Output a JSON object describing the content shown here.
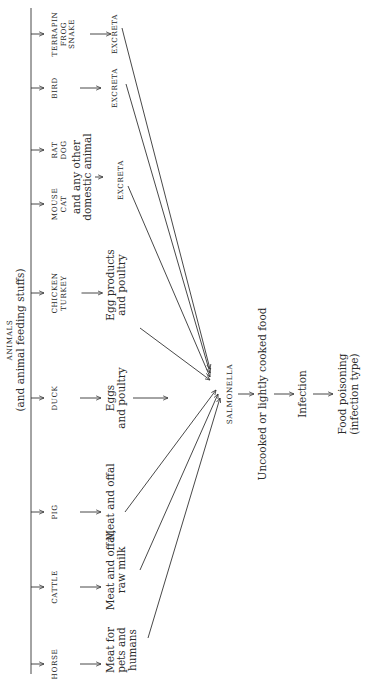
{
  "header": {
    "title": "ANIMALS",
    "subtitle": "(and animal feeding stuffs)"
  },
  "animals": [
    {
      "id": "horse",
      "lines": [
        "HORSE"
      ],
      "x": 16
    },
    {
      "id": "cattle",
      "lines": [
        "CATTLE"
      ],
      "x": 93
    },
    {
      "id": "pig",
      "lines": [
        "PIG"
      ],
      "x": 168
    },
    {
      "id": "duck",
      "lines": [
        "DUCK"
      ],
      "x": 282
    },
    {
      "id": "chicken",
      "lines": [
        "CHICKEN",
        "TURKEY"
      ],
      "x": 387
    },
    {
      "id": "mouse",
      "lines": [
        "MOUSE",
        "CAT"
      ],
      "x": 476
    },
    {
      "id": "rat",
      "lines": [
        "RAT",
        "DOG"
      ],
      "x": 530
    },
    {
      "id": "bird",
      "lines": [
        "BIRD"
      ],
      "x": 592
    },
    {
      "id": "terrapin",
      "lines": [
        "TERRAPIN",
        "FROG",
        "SNAKE"
      ],
      "x": 646
    }
  ],
  "products": [
    {
      "id": "pets-meat",
      "lines": [
        "Meat for",
        "pets and",
        "humans"
      ],
      "x": 30
    },
    {
      "id": "cattle-meat",
      "lines": [
        "Meat and offal,",
        "raw milk"
      ],
      "x": 110
    },
    {
      "id": "pig-meat",
      "lines": [
        "Meat and offal"
      ],
      "x": 178
    },
    {
      "id": "duck-eggs",
      "lines": [
        "Eggs",
        "and poultry"
      ],
      "x": 282
    },
    {
      "id": "chicken-eggs",
      "lines": [
        "Egg products",
        "and poultry"
      ],
      "x": 395
    }
  ],
  "domestic_note": [
    "and any other",
    "domestic animal"
  ],
  "excreta": [
    {
      "id": "excreta-domestic",
      "label": "EXCRETA",
      "x": 500
    },
    {
      "id": "excreta-bird",
      "label": "EXCRETA",
      "x": 592
    },
    {
      "id": "excreta-reptile",
      "label": "EXCRETA",
      "x": 646
    }
  ],
  "center": {
    "label": "SALMONELLA"
  },
  "chain": [
    {
      "id": "food",
      "lines": [
        "Uncooked or lightly cooked food"
      ]
    },
    {
      "id": "infection",
      "lines": [
        "Infection"
      ]
    },
    {
      "id": "outcome",
      "lines": [
        "Food poisoning",
        "(infection type)"
      ]
    }
  ]
}
